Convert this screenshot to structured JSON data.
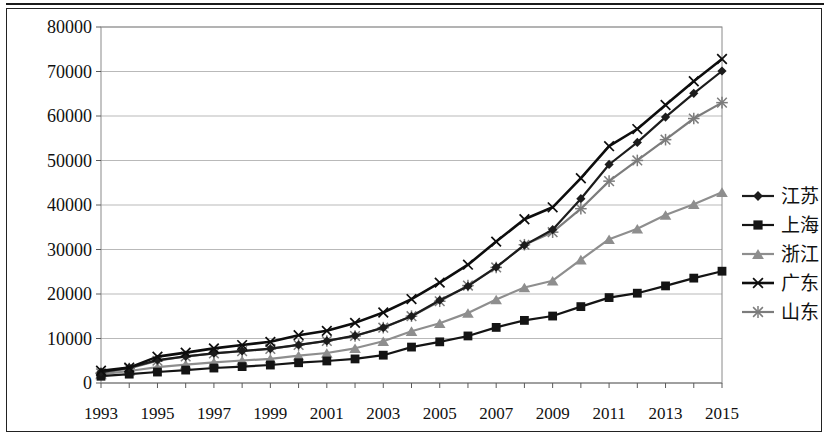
{
  "chart_data": {
    "type": "line",
    "title": "",
    "subtitle": "",
    "xlabel": "",
    "ylabel": "",
    "ylim": [
      0,
      80000
    ],
    "ytick_labels": [
      "0",
      "10000",
      "20000",
      "30000",
      "40000",
      "50000",
      "60000",
      "70000",
      "80000"
    ],
    "ytick_values": [
      0,
      10000,
      20000,
      30000,
      40000,
      50000,
      60000,
      70000,
      80000
    ],
    "grid": true,
    "legend_position": "right",
    "x": [
      1993,
      1994,
      1995,
      1996,
      1997,
      1998,
      1999,
      2000,
      2001,
      2002,
      2003,
      2004,
      2005,
      2006,
      2007,
      2008,
      2009,
      2010,
      2011,
      2012,
      2013,
      2014,
      2015
    ],
    "xtick_labels": [
      "1993",
      "1995",
      "1997",
      "1999",
      "2001",
      "2003",
      "2005",
      "2007",
      "2009",
      "2011",
      "2013",
      "2015"
    ],
    "xtick_values": [
      1993,
      1995,
      1997,
      1999,
      2001,
      2003,
      2005,
      2007,
      2009,
      2011,
      2013,
      2015
    ],
    "series": [
      {
        "name": "江苏",
        "marker": "diamond",
        "color": "#1c1c1c",
        "values": [
          2450,
          3450,
          5155,
          6004,
          6680,
          7200,
          7698,
          8554,
          9457,
          10632,
          12443,
          15004,
          18599,
          21742,
          26018,
          30982,
          34458,
          41425,
          49110,
          54058,
          59753,
          65088,
          70116
        ]
      },
      {
        "name": "上海",
        "marker": "square",
        "color": "#141414",
        "values": [
          1519,
          1991,
          2463,
          2903,
          3360,
          3688,
          4035,
          4551,
          4951,
          5409,
          6251,
          8073,
          9248,
          10572,
          12494,
          14070,
          15046,
          17166,
          19196,
          20182,
          21818,
          23568,
          25123
        ]
      },
      {
        "name": "浙江",
        "marker": "triangle",
        "color": "#8e8e8e",
        "values": [
          1925,
          2690,
          3558,
          4146,
          4638,
          5052,
          5443,
          6141,
          6748,
          7796,
          9395,
          11649,
          13418,
          15743,
          18780,
          21463,
          22990,
          27722,
          32319,
          34665,
          37757,
          40173,
          42886
        ]
      },
      {
        "name": "广东",
        "marker": "x",
        "color": "#0d0d0d",
        "values": [
          2754,
          3469,
          5933,
          6834,
          7774,
          8531,
          9250,
          10741,
          11721,
          13502,
          15845,
          18865,
          22557,
          26588,
          31777,
          36797,
          39483,
          46013,
          53210,
          57068,
          62475,
          67810,
          72813
        ]
      },
      {
        "name": "山东",
        "marker": "star",
        "color": "#7c7c7c",
        "values": [
          2200,
          3250,
          5002,
          5960,
          6650,
          7163,
          7662,
          8542,
          9438,
          10552,
          12435,
          15022,
          18367,
          21900,
          25966,
          31072,
          33897,
          39170,
          45362,
          50013,
          54684,
          59427,
          63002
        ]
      }
    ]
  },
  "legend": {
    "items": [
      {
        "label": "江苏"
      },
      {
        "label": "上海"
      },
      {
        "label": "浙江"
      },
      {
        "label": "广东"
      },
      {
        "label": "山东"
      }
    ]
  }
}
